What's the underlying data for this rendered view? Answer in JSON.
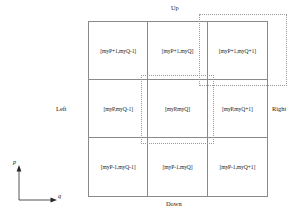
{
  "diagram": {
    "grid": {
      "rows": [
        {
          "row_name": "top-row",
          "cells": [
            {
              "label": "[myP+1,myQ-1]"
            },
            {
              "label": "[myP+1,myQ]"
            },
            {
              "label": "[myP+1,myQ+1]"
            }
          ]
        },
        {
          "row_name": "middle-row",
          "cells": [
            {
              "label": "[myP,myQ-1]"
            },
            {
              "label": "[myP,myQ]"
            },
            {
              "label": "[myP,myQ+1]"
            }
          ]
        },
        {
          "row_name": "bottom-row",
          "cells": [
            {
              "label": "[myP-1,myQ-1]"
            },
            {
              "label": "[myP-1,myQ]"
            },
            {
              "label": "[myP-1,myQ+1]"
            }
          ]
        }
      ]
    },
    "edges": {
      "up": "Up",
      "down": "Down",
      "left": "Left",
      "right": "Right"
    },
    "axes": {
      "vertical": "p",
      "horizontal": "q"
    },
    "overlays": [
      {
        "name": "center-window"
      },
      {
        "name": "upper-right-window"
      }
    ],
    "colors": {
      "grid_line": "#8a8a8a",
      "overlay_line": "#9a9a9a",
      "text": "#1a1a1a",
      "background": "#ffffff"
    }
  }
}
